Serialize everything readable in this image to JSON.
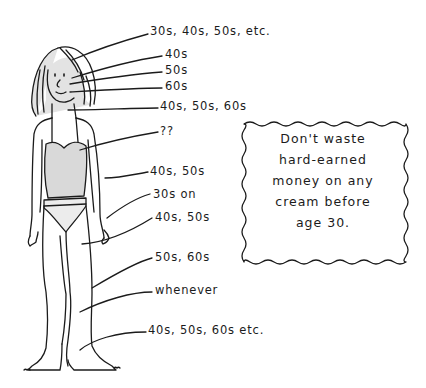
{
  "illustration": {
    "subject": "woman-figure-in-underwear",
    "colors": {
      "ink": "#1b1b1b",
      "shading": "#d9d9d9",
      "background": "#ffffff"
    },
    "callouts": [
      {
        "id": "hair",
        "text": "30s, 40s, 50s, etc."
      },
      {
        "id": "forehead",
        "text": "40s"
      },
      {
        "id": "eyes",
        "text": "50s"
      },
      {
        "id": "mouth",
        "text": "60s"
      },
      {
        "id": "neck",
        "text": "40s, 50s, 60s"
      },
      {
        "id": "chest",
        "text": "??"
      },
      {
        "id": "arms",
        "text": "40s, 50s"
      },
      {
        "id": "hands",
        "text": "30s on"
      },
      {
        "id": "thighs",
        "text": "40s, 50s"
      },
      {
        "id": "knees",
        "text": "50s, 60s"
      },
      {
        "id": "shins",
        "text": "whenever"
      },
      {
        "id": "feet",
        "text": "40s, 50s, 60s etc."
      }
    ],
    "note": {
      "lines": [
        "Don't waste",
        "hard-earned",
        "money on any",
        "cream before",
        "age 30."
      ]
    }
  }
}
